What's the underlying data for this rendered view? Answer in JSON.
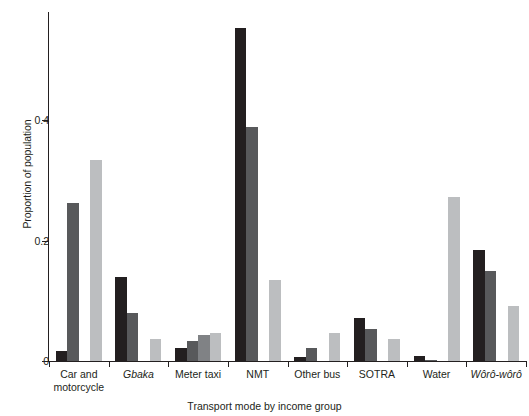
{
  "chart_data": {
    "type": "bar",
    "title": "",
    "xlabel": "Transport mode by income group",
    "ylabel": "Proportion of population",
    "categories": [
      "Car and motorcycle",
      "Gbaka",
      "Meter taxi",
      "NMT",
      "Other bus",
      "SOTRA",
      "Water",
      "Wôrô-wôrô"
    ],
    "category_lines": [
      [
        "Car and",
        "motorcycle"
      ],
      [
        "Gbaka"
      ],
      [
        "Meter taxi"
      ],
      [
        "NMT"
      ],
      [
        "Other bus"
      ],
      [
        "SOTRA"
      ],
      [
        "Water"
      ],
      [
        "Wôrô-wôrô"
      ]
    ],
    "category_italic": [
      false,
      true,
      false,
      false,
      false,
      false,
      false,
      true
    ],
    "series": [
      {
        "name": "income-group-1",
        "color": "#231f20",
        "values": [
          0.016,
          0.139,
          0.021,
          0.553,
          0.007,
          0.072,
          0.008,
          0.184
        ]
      },
      {
        "name": "income-group-2",
        "color": "#58595b",
        "values": [
          0.262,
          0.079,
          0.033,
          0.389,
          0.022,
          0.053,
          0.002,
          0.15
        ]
      },
      {
        "name": "income-group-3",
        "color": "#808285",
        "values": [
          0.0,
          0.0,
          0.044,
          0.0,
          0.0,
          0.0,
          0.0,
          0.0
        ]
      },
      {
        "name": "income-group-4",
        "color": "#bcbec0",
        "values": [
          0.334,
          0.037,
          0.046,
          0.134,
          0.047,
          0.036,
          0.272,
          0.091
        ]
      }
    ],
    "ylim": [
      0,
      0.58
    ],
    "yticks": [
      0,
      0.2,
      0.4
    ],
    "ytick_labels": [
      "0",
      "0.2",
      "0.4"
    ],
    "grid": false,
    "legend": "none"
  },
  "axis": {
    "y_title": "Proportion of population",
    "x_title": "Transport mode by income group"
  }
}
